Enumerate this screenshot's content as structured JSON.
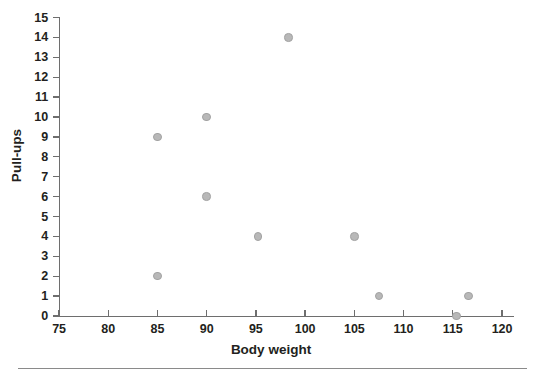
{
  "chart_data": {
    "type": "scatter",
    "title": "",
    "xlabel": "Body weight",
    "ylabel": "Pull-ups",
    "xlim": [
      75,
      122
    ],
    "ylim": [
      0,
      15
    ],
    "xticks": [
      75,
      80,
      85,
      90,
      95,
      100,
      105,
      110,
      115,
      120
    ],
    "yticks": [
      0,
      1,
      2,
      3,
      4,
      5,
      6,
      7,
      8,
      9,
      10,
      11,
      12,
      13,
      14,
      15
    ],
    "grid": false,
    "legend": null,
    "marker": {
      "shape": "circle",
      "fill_color": "#b8b8b8",
      "edge_color": "#a2a2a2",
      "size_px": 8.5
    },
    "axis_color": "#6e6e6e",
    "text_color": "#231f20",
    "points": [
      {
        "x": 85,
        "y": 9
      },
      {
        "x": 85,
        "y": 2
      },
      {
        "x": 90,
        "y": 10
      },
      {
        "x": 90,
        "y": 6
      },
      {
        "x": 95.2,
        "y": 4
      },
      {
        "x": 98.3,
        "y": 14
      },
      {
        "x": 105,
        "y": 4
      },
      {
        "x": 107.5,
        "y": 1
      },
      {
        "x": 115.4,
        "y": 0
      },
      {
        "x": 116.6,
        "y": 1
      }
    ]
  }
}
